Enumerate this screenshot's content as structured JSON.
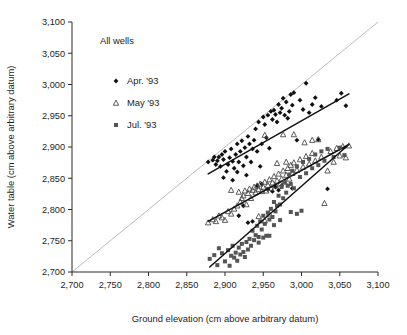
{
  "chart_data": {
    "type": "scatter",
    "title": "",
    "annotation": "All wells",
    "xlabel": "Ground elevation (cm above arbitrary datum)",
    "ylabel": "Water table (cm above arbitrary datum)",
    "xlim": [
      2700,
      3100
    ],
    "ylim": [
      2700,
      3100
    ],
    "xticks": [
      2700,
      2750,
      2800,
      2850,
      2900,
      2950,
      3000,
      3050,
      3100
    ],
    "yticks": [
      2700,
      2750,
      2800,
      2850,
      2900,
      2950,
      3000,
      3050,
      3100
    ],
    "xtick_labels": [
      "2,700",
      "2,750",
      "2,800",
      "2,850",
      "2,900",
      "2,950",
      "3,000",
      "3,050",
      "3,100"
    ],
    "ytick_labels": [
      "2,700",
      "2,750",
      "2,800",
      "2,850",
      "2,900",
      "2,950",
      "3,000",
      "3,050",
      "3,100"
    ],
    "grid": false,
    "legend_position": "upper-left-inside",
    "reference_line": {
      "name": "one-to-one-line",
      "x": [
        2700,
        3100
      ],
      "y": [
        2700,
        3100
      ],
      "color": "#bdbdbd"
    },
    "series": [
      {
        "name": "Apr. '93",
        "marker": "diamond",
        "color": "#111111",
        "fit_line": {
          "x": [
            2878,
            3062
          ],
          "y": [
            2857,
            2985
          ]
        },
        "points": [
          [
            2878,
            2876
          ],
          [
            2884,
            2879
          ],
          [
            2886,
            2884
          ],
          [
            2888,
            2872
          ],
          [
            2890,
            2878
          ],
          [
            2892,
            2884
          ],
          [
            2894,
            2869
          ],
          [
            2896,
            2888
          ],
          [
            2898,
            2880
          ],
          [
            2900,
            2893
          ],
          [
            2902,
            2861
          ],
          [
            2904,
            2872
          ],
          [
            2906,
            2883
          ],
          [
            2908,
            2897
          ],
          [
            2910,
            2877
          ],
          [
            2912,
            2866
          ],
          [
            2914,
            2888
          ],
          [
            2916,
            2905
          ],
          [
            2918,
            2876
          ],
          [
            2920,
            2893
          ],
          [
            2922,
            2910
          ],
          [
            2924,
            2870
          ],
          [
            2926,
            2899
          ],
          [
            2928,
            2884
          ],
          [
            2930,
            2917
          ],
          [
            2932,
            2905
          ],
          [
            2934,
            2876
          ],
          [
            2936,
            2897
          ],
          [
            2938,
            2911
          ],
          [
            2940,
            2929
          ],
          [
            2942,
            2893
          ],
          [
            2944,
            2940
          ],
          [
            2946,
            2869
          ],
          [
            2948,
            2905
          ],
          [
            2950,
            2948
          ],
          [
            2952,
            2936
          ],
          [
            2954,
            2915
          ],
          [
            2956,
            2951
          ],
          [
            2958,
            2898
          ],
          [
            2960,
            2957
          ],
          [
            2962,
            2944
          ],
          [
            2964,
            2959
          ],
          [
            2966,
            2952
          ],
          [
            2968,
            2940
          ],
          [
            2970,
            2968
          ],
          [
            2972,
            2955
          ],
          [
            2974,
            2962
          ],
          [
            2976,
            2978
          ],
          [
            2978,
            2951
          ],
          [
            2980,
            2972
          ],
          [
            2982,
            2946
          ],
          [
            2984,
            2957
          ],
          [
            2986,
            2984
          ],
          [
            2988,
            2967
          ],
          [
            2990,
            2987
          ],
          [
            2994,
            2911
          ],
          [
            2998,
            2975
          ],
          [
            3002,
            2960
          ],
          [
            3006,
            3002
          ],
          [
            3010,
            2955
          ],
          [
            3014,
            2968
          ],
          [
            3018,
            2979
          ],
          [
            3022,
            2912
          ],
          [
            3026,
            2965
          ],
          [
            3034,
            2833
          ],
          [
            3046,
            2975
          ],
          [
            3052,
            2986
          ],
          [
            3058,
            2966
          ],
          [
            2924,
            2806
          ],
          [
            2936,
            2781
          ],
          [
            2942,
            2838
          ],
          [
            2948,
            2841
          ],
          [
            2956,
            2832
          ],
          [
            2966,
            2836
          ],
          [
            2974,
            2838
          ],
          [
            2918,
            2790
          ],
          [
            2930,
            2779
          ],
          [
            2962,
            2829
          ],
          [
            2970,
            2831
          ],
          [
            2988,
            2834
          ],
          [
            2898,
            2851
          ],
          [
            2910,
            2847
          ],
          [
            2916,
            2860
          ],
          [
            2928,
            2855
          ]
        ]
      },
      {
        "name": "May '93",
        "marker": "triangle",
        "color": "#4a4a4a",
        "fit_line": {
          "x": [
            2878,
            3062
          ],
          "y": [
            2781,
            2904
          ]
        },
        "points": [
          [
            2878,
            2779
          ],
          [
            2884,
            2784
          ],
          [
            2888,
            2781
          ],
          [
            2892,
            2790
          ],
          [
            2896,
            2787
          ],
          [
            2900,
            2783
          ],
          [
            2904,
            2797
          ],
          [
            2908,
            2793
          ],
          [
            2912,
            2801
          ],
          [
            2916,
            2806
          ],
          [
            2918,
            2828
          ],
          [
            2920,
            2812
          ],
          [
            2922,
            2818
          ],
          [
            2924,
            2822
          ],
          [
            2926,
            2830
          ],
          [
            2928,
            2808
          ],
          [
            2930,
            2826
          ],
          [
            2932,
            2833
          ],
          [
            2934,
            2818
          ],
          [
            2936,
            2831
          ],
          [
            2938,
            2836
          ],
          [
            2940,
            2827
          ],
          [
            2942,
            2838
          ],
          [
            2944,
            2832
          ],
          [
            2946,
            2841
          ],
          [
            2948,
            2829
          ],
          [
            2950,
            2836
          ],
          [
            2952,
            2844
          ],
          [
            2954,
            2830
          ],
          [
            2956,
            2839
          ],
          [
            2958,
            2848
          ],
          [
            2960,
            2834
          ],
          [
            2962,
            2843
          ],
          [
            2964,
            2853
          ],
          [
            2966,
            2838
          ],
          [
            2968,
            2846
          ],
          [
            2970,
            2857
          ],
          [
            2972,
            2841
          ],
          [
            2974,
            2849
          ],
          [
            2976,
            2862
          ],
          [
            2978,
            2844
          ],
          [
            2980,
            2855
          ],
          [
            2982,
            2866
          ],
          [
            2984,
            2849
          ],
          [
            2986,
            2871
          ],
          [
            2988,
            2858
          ],
          [
            2990,
            2875
          ],
          [
            2994,
            2863
          ],
          [
            2998,
            2880
          ],
          [
            3002,
            2868
          ],
          [
            3006,
            2885
          ],
          [
            3010,
            2873
          ],
          [
            3014,
            2890
          ],
          [
            3018,
            2878
          ],
          [
            3022,
            2912
          ],
          [
            3026,
            2884
          ],
          [
            3030,
            2810
          ],
          [
            3034,
            2862
          ],
          [
            3038,
            2893
          ],
          [
            3042,
            2876
          ],
          [
            3046,
            2898
          ],
          [
            3050,
            2886
          ],
          [
            3054,
            2901
          ],
          [
            3058,
            2883
          ],
          [
            3062,
            2902
          ],
          [
            2908,
            2831
          ],
          [
            2952,
            2919
          ],
          [
            2976,
            2920
          ],
          [
            2990,
            2920
          ],
          [
            2944,
            2789
          ],
          [
            2952,
            2782
          ],
          [
            2958,
            2793
          ],
          [
            2968,
            2874
          ],
          [
            2980,
            2876
          ],
          [
            3004,
            2907
          ],
          [
            3014,
            2911
          ]
        ]
      },
      {
        "name": "Jul. '93",
        "marker": "square",
        "color": "#555555",
        "fit_line": {
          "x": [
            2880,
            3060
          ],
          "y": [
            2708,
            2902
          ]
        },
        "points": [
          [
            2880,
            2721
          ],
          [
            2886,
            2727
          ],
          [
            2890,
            2711
          ],
          [
            2892,
            2738
          ],
          [
            2896,
            2730
          ],
          [
            2900,
            2717
          ],
          [
            2904,
            2735
          ],
          [
            2906,
            2710
          ],
          [
            2908,
            2726
          ],
          [
            2910,
            2742
          ],
          [
            2912,
            2723
          ],
          [
            2914,
            2731
          ],
          [
            2916,
            2718
          ],
          [
            2918,
            2739
          ],
          [
            2920,
            2728
          ],
          [
            2922,
            2745
          ],
          [
            2924,
            2732
          ],
          [
            2926,
            2724
          ],
          [
            2928,
            2748
          ],
          [
            2930,
            2736
          ],
          [
            2932,
            2753
          ],
          [
            2934,
            2742
          ],
          [
            2936,
            2766
          ],
          [
            2938,
            2751
          ],
          [
            2940,
            2759
          ],
          [
            2942,
            2774
          ],
          [
            2944,
            2756
          ],
          [
            2946,
            2781
          ],
          [
            2948,
            2768
          ],
          [
            2950,
            2790
          ],
          [
            2952,
            2777
          ],
          [
            2954,
            2758
          ],
          [
            2956,
            2795
          ],
          [
            2958,
            2784
          ],
          [
            2960,
            2801
          ],
          [
            2962,
            2788
          ],
          [
            2964,
            2812
          ],
          [
            2966,
            2797
          ],
          [
            2968,
            2806
          ],
          [
            2970,
            2822
          ],
          [
            2972,
            2808
          ],
          [
            2974,
            2836
          ],
          [
            2976,
            2818
          ],
          [
            2978,
            2844
          ],
          [
            2980,
            2827
          ],
          [
            2982,
            2838
          ],
          [
            2984,
            2856
          ],
          [
            2986,
            2841
          ],
          [
            2988,
            2862
          ],
          [
            2990,
            2834
          ],
          [
            2994,
            2869
          ],
          [
            2998,
            2852
          ],
          [
            3002,
            2876
          ],
          [
            3006,
            2858
          ],
          [
            3010,
            2881
          ],
          [
            3014,
            2866
          ],
          [
            3018,
            2888
          ],
          [
            3022,
            2871
          ],
          [
            3026,
            2893
          ],
          [
            3030,
            2878
          ],
          [
            3034,
            2897
          ],
          [
            3042,
            2884
          ],
          [
            3050,
            2899
          ],
          [
            3056,
            2887
          ],
          [
            2986,
            2796
          ],
          [
            2994,
            2793
          ],
          [
            3000,
            2798
          ],
          [
            2972,
            2783
          ],
          [
            2964,
            2775
          ],
          [
            2958,
            2758
          ],
          [
            2950,
            2755
          ],
          [
            2944,
            2747
          ]
        ]
      }
    ]
  }
}
